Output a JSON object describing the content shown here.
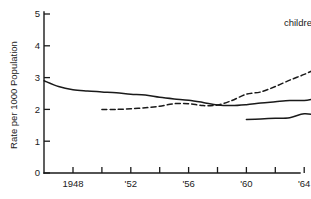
{
  "chart_data": {
    "type": "line",
    "title": "",
    "xlabel": "",
    "ylabel": "Rate per 1000 Population",
    "xlim": [
      1946,
      1975
    ],
    "ylim": [
      0,
      5
    ],
    "grid": false,
    "legend_position": "inline-labels",
    "y_ticks": [
      "0",
      "1",
      "2",
      "3",
      "4",
      "5"
    ],
    "y_tick_values": [
      0,
      1,
      2,
      3,
      4,
      5
    ],
    "x_ticks": [
      "1948",
      "'52",
      "'56",
      "'60",
      "'64",
      "'68",
      "'72"
    ],
    "x_tick_values": [
      1948,
      1952,
      1956,
      1960,
      1964,
      1968,
      1972
    ],
    "x_minor_tick_values": [
      1950,
      1954,
      1958,
      1962,
      1966,
      1970,
      1974
    ],
    "series": [
      {
        "name": "divorce",
        "style": "solid",
        "label": "divorce",
        "label_x": 1973.1,
        "label_y": 4.92,
        "x": [
          1946,
          1947,
          1948,
          1949,
          1950,
          1951,
          1952,
          1953,
          1954,
          1955,
          1956,
          1957,
          1958,
          1959,
          1960,
          1961,
          1962,
          1963,
          1964,
          1965,
          1966,
          1967,
          1968,
          1969,
          1970,
          1971,
          1972,
          1973,
          1974
        ],
        "values": [
          2.9,
          2.72,
          2.62,
          2.58,
          2.55,
          2.52,
          2.48,
          2.45,
          2.38,
          2.33,
          2.29,
          2.22,
          2.14,
          2.12,
          2.15,
          2.2,
          2.24,
          2.28,
          2.28,
          2.36,
          2.42,
          2.48,
          2.5,
          2.74,
          3.1,
          3.45,
          3.75,
          4.1,
          4.6
        ]
      },
      {
        "name": "children in divorce",
        "style": "dashed",
        "label": "children in divorce",
        "label_x": 1962.6,
        "label_y": 4.62,
        "x": [
          1950,
          1951,
          1952,
          1953,
          1954,
          1955,
          1956,
          1957,
          1958,
          1959,
          1960,
          1961,
          1962,
          1963,
          1964,
          1965,
          1966,
          1967,
          1968,
          1969,
          1970
        ],
        "values": [
          2.0,
          2.0,
          2.02,
          2.05,
          2.1,
          2.18,
          2.18,
          2.12,
          2.14,
          2.28,
          2.48,
          2.55,
          2.72,
          2.92,
          3.1,
          3.3,
          3.48,
          3.68,
          3.95,
          4.2,
          4.3
        ]
      },
      {
        "name": "remarriage",
        "style": "solid",
        "label": "remarriage",
        "label_x": 1970.2,
        "label_y": 2.35,
        "x": [
          1960,
          1961,
          1962,
          1963,
          1964,
          1965,
          1966,
          1967,
          1968,
          1969,
          1970,
          1971,
          1972,
          1973,
          1974
        ],
        "values": [
          1.68,
          1.7,
          1.72,
          1.74,
          1.86,
          1.82,
          1.82,
          1.88,
          1.96,
          2.05,
          2.14,
          2.13,
          2.16,
          2.17,
          2.18
        ]
      }
    ]
  },
  "axis": {
    "y_title": "Rate per 1000 Population"
  }
}
